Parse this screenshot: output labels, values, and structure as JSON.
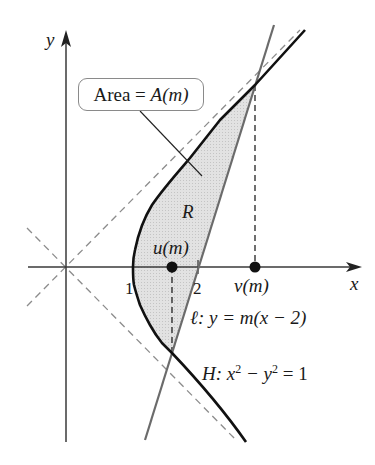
{
  "figure": {
    "axes": {
      "x_label": "x",
      "y_label": "y",
      "tick_1": "1",
      "tick_2": "2"
    },
    "region_label": "R",
    "area_box": {
      "prefix": "Area = ",
      "func": "A",
      "arg": "(m)"
    },
    "points": {
      "u_label_func": "u",
      "u_label_arg": "(m)",
      "v_label_func": "v",
      "v_label_arg": "(m)"
    },
    "line_label": {
      "name": "ℓ",
      "eq": ": y = m(x − 2)"
    },
    "hyperbola_label": {
      "name": "H",
      "eq_a": ": x",
      "exp1": "2",
      "eq_b": " − y",
      "exp2": "2",
      "eq_c": " = 1"
    },
    "colors": {
      "hyperbola": "#111111",
      "line": "#6b6b6b",
      "asymptote": "#8c8c8c",
      "region_fill": "#dcdcdc",
      "axis": "#3a3a3a"
    }
  }
}
